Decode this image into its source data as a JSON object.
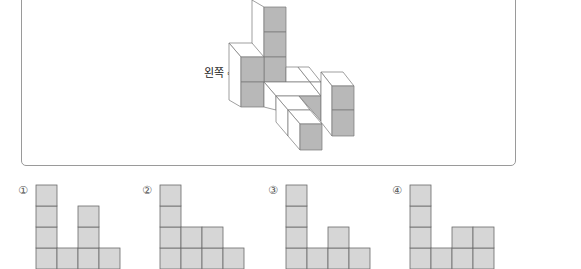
{
  "figure": {
    "direction_label": "왼쪽 ⇨",
    "colors": {
      "gray": "#b8b8b8",
      "white": "#ffffff",
      "stroke": "#777777"
    },
    "faces": [
      {
        "fill": "white",
        "pts": "252,0 264,7 264,82 252,75"
      },
      {
        "fill": "gray",
        "pts": "264,7 286,7 286,32 264,32"
      },
      {
        "fill": "gray",
        "pts": "264,32 286,32 286,57 264,57"
      },
      {
        "fill": "gray",
        "pts": "264,57 286,57 286,82 264,82"
      },
      {
        "fill": "white",
        "pts": "229,43 252,43 264,57 241,57"
      },
      {
        "fill": "white",
        "pts": "229,43 241,57 241,107 229,100"
      },
      {
        "fill": "gray",
        "pts": "241,57 264,57 264,82 241,82"
      },
      {
        "fill": "gray",
        "pts": "241,82 264,82 264,107 241,107"
      },
      {
        "fill": "white",
        "pts": "286,67 298,67 310,82 286,82"
      },
      {
        "fill": "white",
        "pts": "298,67 309,67 321,82 310,82"
      },
      {
        "fill": "white",
        "pts": "264,82 310,82 321,96 276,96"
      },
      {
        "fill": "white",
        "pts": "310,82 321,82 321,96"
      },
      {
        "fill": "white",
        "pts": "264,82 276,96 276,110 264,107"
      },
      {
        "fill": "white",
        "pts": "276,96 299,96 310,110 288,110"
      },
      {
        "fill": "gray",
        "pts": "299,96 321,96 321,121"
      },
      {
        "fill": "white",
        "pts": "276,96 288,110 288,136 276,122"
      },
      {
        "fill": "white",
        "pts": "288,110 310,110 322,124 300,124"
      },
      {
        "fill": "white",
        "pts": "288,110 300,124 300,150 288,136"
      },
      {
        "fill": "gray",
        "pts": "300,124 322,124 322,150 300,150"
      },
      {
        "fill": "white",
        "pts": "321,72 343,72 354,86 332,86"
      },
      {
        "fill": "white",
        "pts": "321,72 332,86 332,136 321,122"
      },
      {
        "fill": "gray",
        "pts": "332,86 354,86 354,110 332,110"
      },
      {
        "fill": "gray",
        "pts": "332,110 354,110 354,136 332,136"
      }
    ]
  },
  "options": [
    {
      "number": "①",
      "x": 33,
      "columns": [
        4,
        1,
        3,
        1
      ]
    },
    {
      "number": "②",
      "x": 157,
      "columns": [
        4,
        2,
        2,
        1
      ]
    },
    {
      "number": "③",
      "x": 283,
      "columns": [
        4,
        1,
        2,
        1
      ]
    },
    {
      "number": "④",
      "x": 407,
      "columns": [
        4,
        1,
        2,
        2
      ]
    }
  ],
  "option_style": {
    "cell": 21,
    "base_y": 269,
    "fill": "#d6d6d6",
    "stroke": "#6a6a6a"
  }
}
